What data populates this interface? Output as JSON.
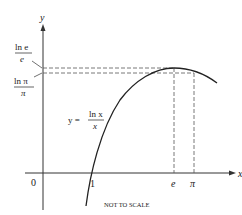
{
  "diagram": {
    "axes": {
      "x_label": "x",
      "y_label": "y",
      "origin_label": "0"
    },
    "x_ticks": [
      {
        "label": "1",
        "name": "x-tick-1"
      },
      {
        "label": "e",
        "name": "x-tick-e"
      },
      {
        "label": "π",
        "name": "x-tick-pi"
      }
    ],
    "y_ticks": {
      "ln_e_over_e": {
        "num": "ln e",
        "den": "e"
      },
      "ln_pi_over_pi": {
        "num": "ln π",
        "den": "π"
      }
    },
    "function_label": {
      "lhs": "y =",
      "num": "ln x",
      "den": "x"
    },
    "note": "NOT TO SCALE",
    "colors": {
      "line": "#222222",
      "dash": "#555555"
    }
  }
}
